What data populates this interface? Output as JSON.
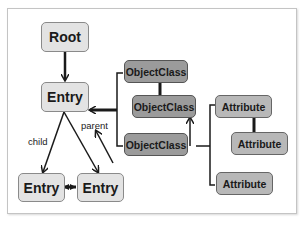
{
  "diagram": {
    "nodes": {
      "root": "Root",
      "entry_main": "Entry",
      "entry_child_left": "Entry",
      "entry_child_right": "Entry",
      "objectclass_1": "ObjectClass",
      "objectclass_2": "ObjectClass",
      "objectclass_3": "ObjectClass",
      "attribute_1": "Attribute",
      "attribute_2": "Attribute",
      "attribute_3": "Attribute"
    },
    "edge_labels": {
      "child": "child",
      "parent": "parent"
    },
    "colors": {
      "light_node": "#e3e3e3",
      "objectclass_node": "#9b9b9b",
      "attribute_node": "#b8b8b8",
      "line": "#1a1a1a"
    }
  }
}
